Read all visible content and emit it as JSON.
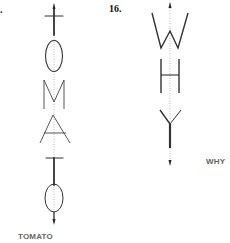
{
  "figures": [
    {
      "number": "",
      "letters": [
        "T",
        "O",
        "M",
        "A",
        "T",
        "O"
      ],
      "caption": "TOMATO"
    },
    {
      "number": "16.",
      "letters": [
        "W",
        "H",
        "Y"
      ],
      "caption": "WHY"
    }
  ],
  "colors": {
    "stroke": "#333333",
    "axis": "#9a9a9a",
    "caption": "#666666"
  }
}
